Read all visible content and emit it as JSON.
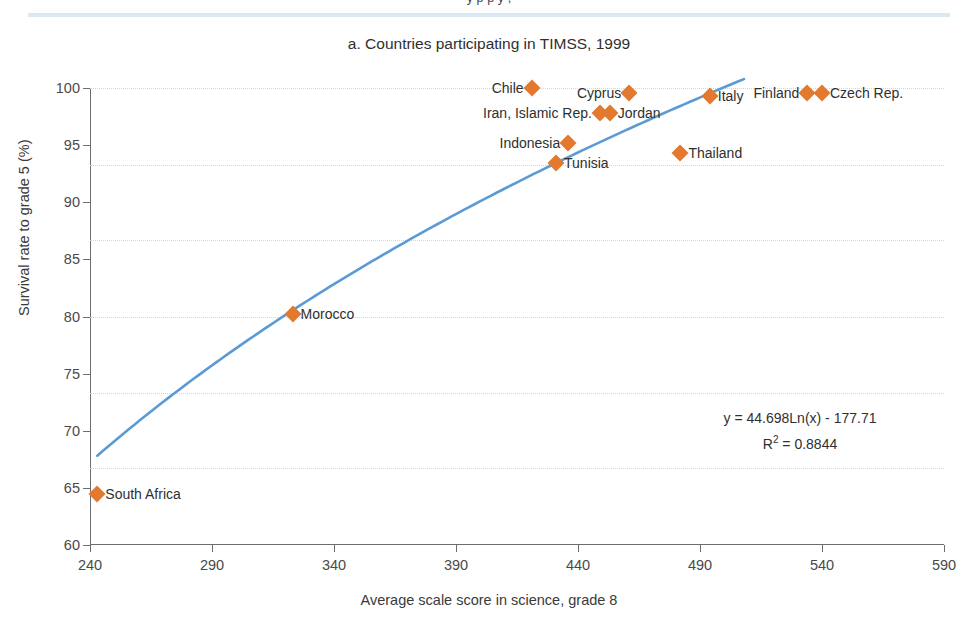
{
  "page": {
    "top_cut_text": "y       p                    p                                  y                                                        ,",
    "title": "a. Countries participating in TIMSS, 1999"
  },
  "chart_data": {
    "type": "scatter",
    "title": "a. Countries participating in TIMSS, 1999",
    "xlabel": "Average scale score in science, grade 8",
    "ylabel": "Survival rate to grade 5 (%)",
    "xlim": [
      240,
      590
    ],
    "ylim": [
      60,
      100
    ],
    "xticks": [
      240,
      290,
      340,
      390,
      440,
      490,
      540,
      590
    ],
    "yticks": [
      60,
      65,
      70,
      75,
      80,
      85,
      90,
      95,
      100
    ],
    "grid": "horizontal-dotted",
    "gridline_values": [
      100,
      93.3,
      86.7,
      80,
      73.3,
      66.7
    ],
    "legend": "none",
    "marker_color": "#e2792f",
    "trendline_color": "#5b9bd5",
    "points": [
      {
        "label": "South Africa",
        "x": 243,
        "y": 64.5,
        "label_side": "right"
      },
      {
        "label": "Morocco",
        "x": 323,
        "y": 80.2,
        "label_side": "right"
      },
      {
        "label": "Tunisia",
        "x": 431,
        "y": 93.4,
        "label_side": "right"
      },
      {
        "label": "Indonesia",
        "x": 436,
        "y": 95.2,
        "label_side": "left"
      },
      {
        "label": "Iran, Islamic Rep.",
        "x": 449,
        "y": 97.8,
        "label_side": "left"
      },
      {
        "label": "Jordan",
        "x": 453,
        "y": 97.8,
        "label_side": "right"
      },
      {
        "label": "Chile",
        "x": 421,
        "y": 100.0,
        "label_side": "left"
      },
      {
        "label": "Cyprus",
        "x": 461,
        "y": 99.6,
        "label_side": "left"
      },
      {
        "label": "Thailand",
        "x": 482,
        "y": 94.3,
        "label_side": "right"
      },
      {
        "label": "Italy",
        "x": 494,
        "y": 99.3,
        "label_side": "right"
      },
      {
        "label": "Finland",
        "x": 534,
        "y": 99.6,
        "label_side": "left"
      },
      {
        "label": "Czech Rep.",
        "x": 540,
        "y": 99.6,
        "label_side": "right"
      }
    ],
    "trendline": {
      "equation": "y = 44.698Ln(x) - 177.71",
      "r_squared_label": "R",
      "r_squared_exponent": "2",
      "r_squared_value": "= 0.8844",
      "formula": "44.698*ln(x) - 177.71",
      "x_start": 243,
      "x_end": 508
    }
  }
}
